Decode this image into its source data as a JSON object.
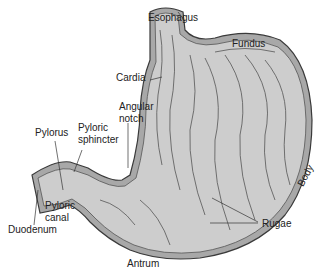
{
  "diagram": {
    "colors": {
      "fill": "#c9c9c9",
      "wall": "#9a9a9a",
      "outline": "#3a3a3a",
      "text": "#222222"
    },
    "labels": {
      "esophagus": "Esophagus",
      "fundus": "Fundus",
      "cardia": "Cardia",
      "angular_notch_1": "Angular",
      "angular_notch_2": "notch",
      "pylorus": "Pylorus",
      "pyloric_sphincter_1": "Pyloric",
      "pyloric_sphincter_2": "sphincter",
      "pyloric_canal_1": "Pyloric",
      "pyloric_canal_2": "canal",
      "duodenum": "Duodenum",
      "body": "Body",
      "rugae": "Rugae",
      "antrum": "Antrum"
    }
  }
}
